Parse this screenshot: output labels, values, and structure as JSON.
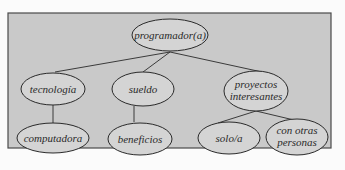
{
  "diagram": {
    "type": "tree",
    "colors": {
      "frame_fill": "#c9c9c9",
      "frame_stroke": "#4a4a4a",
      "ellipse_fill": "#d4d4d4",
      "stroke": "#2a2a2a",
      "text": "#2a2a2a"
    },
    "root": {
      "label": "programador(a)"
    },
    "level2": [
      {
        "label_lines": [
          "tecnología"
        ]
      },
      {
        "label_lines": [
          "sueldo"
        ]
      },
      {
        "label_lines": [
          "proyectos",
          "interesantes"
        ]
      }
    ],
    "level3": [
      {
        "parent": 0,
        "label_lines": [
          "computadora"
        ]
      },
      {
        "parent": 1,
        "label_lines": [
          "beneficios"
        ]
      },
      {
        "parent": 2,
        "label_lines": [
          "solo/a"
        ]
      },
      {
        "parent": 2,
        "label_lines": [
          "con otras",
          "personas"
        ]
      }
    ]
  }
}
